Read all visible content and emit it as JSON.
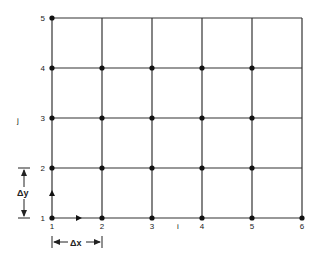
{
  "diagram": {
    "type": "computational-grid",
    "i_values": [
      1,
      2,
      3,
      4,
      5,
      6
    ],
    "j_values": [
      1,
      2,
      3,
      4,
      5
    ],
    "x_axis_label": "i",
    "y_axis_label": "j",
    "dx_label": "Δx",
    "dy_label": "Δy",
    "nodes": [
      [
        1,
        1
      ],
      [
        2,
        1
      ],
      [
        3,
        1
      ],
      [
        4,
        1
      ],
      [
        5,
        1
      ],
      [
        6,
        1
      ],
      [
        1,
        2
      ],
      [
        2,
        2
      ],
      [
        3,
        2
      ],
      [
        4,
        2
      ],
      [
        5,
        2
      ],
      [
        1,
        3
      ],
      [
        2,
        3
      ],
      [
        3,
        3
      ],
      [
        4,
        3
      ],
      [
        5,
        3
      ],
      [
        1,
        4
      ],
      [
        2,
        4
      ],
      [
        3,
        4
      ],
      [
        4,
        4
      ],
      [
        5,
        4
      ],
      [
        1,
        5
      ]
    ],
    "line_color": "#333333",
    "node_color": "#111111"
  }
}
